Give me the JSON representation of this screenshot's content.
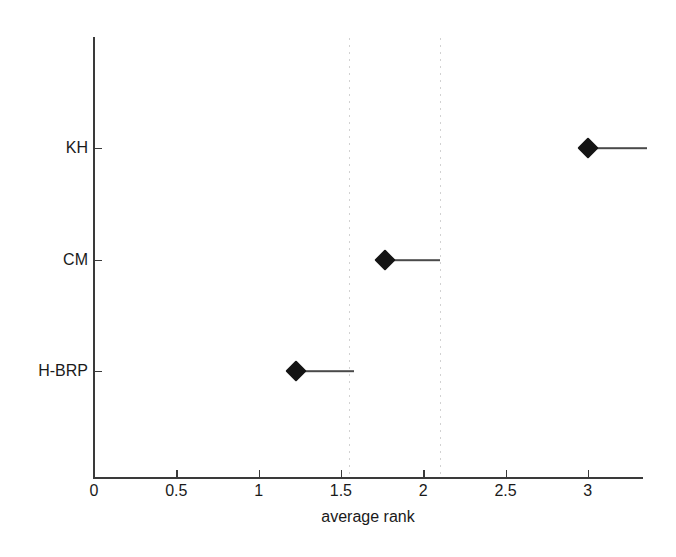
{
  "chart_data": {
    "type": "scatter",
    "title": "",
    "subtitle": "",
    "xlabel": "average rank",
    "ylabel": "",
    "xlim": [
      0,
      3.34
    ],
    "ylim": [
      0,
      4
    ],
    "grid": "vertical-dotted",
    "legend": "none",
    "orientation": "horizontal",
    "marker": "filled-diamond",
    "x_ticks": [
      {
        "value": 0,
        "label": "0"
      },
      {
        "value": 0.5,
        "label": "0.5"
      },
      {
        "value": 1,
        "label": "1"
      },
      {
        "value": 1.5,
        "label": "1.5"
      },
      {
        "value": 2,
        "label": "2"
      },
      {
        "value": 2.5,
        "label": "2.5"
      },
      {
        "value": 3,
        "label": "3"
      }
    ],
    "categories": [
      "H-BRP",
      "CM",
      "KH"
    ],
    "y_ticks": [
      {
        "label": "KH",
        "position": 3
      },
      {
        "label": "CM",
        "position": 2
      },
      {
        "label": "H-BRP",
        "position": 1
      }
    ],
    "values": [
      1.23,
      1.77,
      3.0
    ],
    "points": [
      {
        "label": "KH",
        "value": 3.0,
        "whisker_end": 3.36,
        "row": 3
      },
      {
        "label": "CM",
        "value": 1.77,
        "whisker_end": 2.1,
        "row": 2
      },
      {
        "label": "H-BRP",
        "value": 1.23,
        "whisker_end": 1.58,
        "row": 1
      }
    ],
    "gridline_values": [
      1.55,
      2.1
    ],
    "colors": {
      "marker": "#141414",
      "line": "#4a4a4a",
      "axis": "#3a3a3a",
      "grid": "#d2d2d2",
      "text": "#1a1a1a",
      "background": "#ffffff"
    }
  }
}
